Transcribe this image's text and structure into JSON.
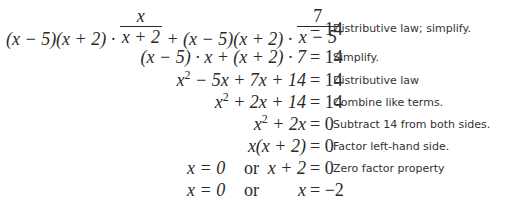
{
  "steps": [
    {
      "equation": {
        "lhs_parts": {
          "part1": "(x − 5)(x + 2) · ",
          "frac1_num": "x",
          "frac1_den": "x + 2",
          "part2": " + (x − 5)(x + 2) · ",
          "frac2_num": "7",
          "frac2_den": "x − 5"
        },
        "rhs": "= 14"
      },
      "note": "Distributive law; simplify."
    },
    {
      "equation": {
        "lhs": "(x − 5) · x + (x + 2) · 7",
        "rhs": "= 14"
      },
      "note": "Simplify."
    },
    {
      "equation": {
        "lhs_base": "x",
        "lhs_exp": "2",
        "lhs_rest": " − 5x + 7x + 14",
        "rhs": "= 14"
      },
      "note": "Distributive law"
    },
    {
      "equation": {
        "lhs_base": "x",
        "lhs_exp": "2",
        "lhs_rest": " + 2x + 14",
        "rhs": "= 14"
      },
      "note": "Combine like terms."
    },
    {
      "equation": {
        "lhs_base": "x",
        "lhs_exp": "2",
        "lhs_rest": " + 2x",
        "rhs": "= 0"
      },
      "note": "Subtract 14 from both sides."
    },
    {
      "equation": {
        "lhs": "x(x + 2)",
        "rhs": "= 0"
      },
      "note": "Factor left-hand side."
    },
    {
      "equation": {
        "lhs_a": "x = 0",
        "or": "or",
        "lhs_b": "x + 2",
        "rhs": "= 0"
      },
      "note": "Zero factor property"
    },
    {
      "equation": {
        "lhs_a": "x = 0",
        "or": "or",
        "lhs_b": "x",
        "rhs": "= −2"
      },
      "note": ""
    }
  ]
}
